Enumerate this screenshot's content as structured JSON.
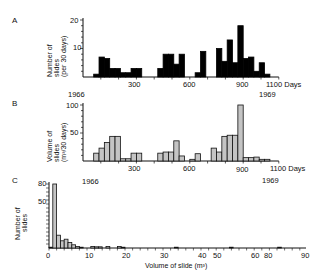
{
  "chart_data": [
    {
      "panel": "A",
      "type": "bar",
      "ylabel": "Number of slides (per 30 days)",
      "xlabel": "Days",
      "x_ticks": [
        "300",
        "600",
        "900",
        "1100 Days"
      ],
      "y_ticks": [
        "10",
        "20"
      ],
      "ylim": [
        0,
        20
      ],
      "xlim": [
        0,
        1100
      ],
      "bin_width_days": 30,
      "bins": [
        {
          "start": 60,
          "value": 1
        },
        {
          "start": 90,
          "value": 7
        },
        {
          "start": 120,
          "value": 6.5
        },
        {
          "start": 150,
          "value": 3
        },
        {
          "start": 180,
          "value": 3
        },
        {
          "start": 210,
          "value": 1.5
        },
        {
          "start": 240,
          "value": 1.5
        },
        {
          "start": 270,
          "value": 3
        },
        {
          "start": 300,
          "value": 3
        },
        {
          "start": 420,
          "value": 3
        },
        {
          "start": 450,
          "value": 8
        },
        {
          "start": 480,
          "value": 8
        },
        {
          "start": 510,
          "value": 4.5
        },
        {
          "start": 540,
          "value": 8
        },
        {
          "start": 630,
          "value": 1.5
        },
        {
          "start": 660,
          "value": 9
        },
        {
          "start": 750,
          "value": 10
        },
        {
          "start": 780,
          "value": 5.5
        },
        {
          "start": 810,
          "value": 13
        },
        {
          "start": 840,
          "value": 5
        },
        {
          "start": 870,
          "value": 18
        },
        {
          "start": 900,
          "value": 6.5
        },
        {
          "start": 930,
          "value": 7
        },
        {
          "start": 960,
          "value": 2
        },
        {
          "start": 990,
          "value": 5
        },
        {
          "start": 1020,
          "value": 1
        }
      ]
    },
    {
      "panel": "B",
      "type": "bar",
      "ylabel": "Volume of slides (m³/30 days)",
      "xlabel": "Days",
      "x_ticks": [
        "300",
        "600",
        "900",
        "1100 Days"
      ],
      "y_ticks": [
        "50",
        "100"
      ],
      "ylim": [
        0,
        100
      ],
      "xlim": [
        0,
        1100
      ],
      "year_labels": [
        "1966",
        "1969"
      ],
      "bins": [
        {
          "start": 60,
          "value": 14
        },
        {
          "start": 90,
          "value": 23
        },
        {
          "start": 120,
          "value": 33
        },
        {
          "start": 150,
          "value": 44
        },
        {
          "start": 180,
          "value": 44
        },
        {
          "start": 210,
          "value": 4
        },
        {
          "start": 240,
          "value": 4
        },
        {
          "start": 270,
          "value": 14
        },
        {
          "start": 300,
          "value": 14
        },
        {
          "start": 420,
          "value": 14
        },
        {
          "start": 450,
          "value": 16
        },
        {
          "start": 480,
          "value": 16
        },
        {
          "start": 510,
          "value": 36
        },
        {
          "start": 540,
          "value": 9
        },
        {
          "start": 600,
          "value": 3
        },
        {
          "start": 630,
          "value": 13
        },
        {
          "start": 720,
          "value": 23
        },
        {
          "start": 750,
          "value": 16
        },
        {
          "start": 780,
          "value": 44
        },
        {
          "start": 810,
          "value": 46
        },
        {
          "start": 840,
          "value": 46
        },
        {
          "start": 870,
          "value": 100
        },
        {
          "start": 900,
          "value": 6
        },
        {
          "start": 930,
          "value": 6
        },
        {
          "start": 960,
          "value": 7
        },
        {
          "start": 990,
          "value": 3
        },
        {
          "start": 1020,
          "value": 3
        }
      ]
    },
    {
      "panel": "C",
      "type": "bar",
      "ylabel": "Number of slides",
      "xlabel": "Volume of slide (m³)",
      "x_ticks": [
        "0",
        "10",
        "20",
        "30",
        "40",
        "50",
        "60",
        "80",
        "90"
      ],
      "y_ticks": [
        "50",
        "80"
      ],
      "ylim": [
        0,
        80
      ],
      "year_labels": [
        "1966",
        "1969"
      ],
      "bins": [
        {
          "start": 0,
          "value": 1
        },
        {
          "start": 1,
          "value": 80
        },
        {
          "start": 2,
          "value": 16
        },
        {
          "start": 3,
          "value": 9
        },
        {
          "start": 4,
          "value": 11
        },
        {
          "start": 5,
          "value": 7
        },
        {
          "start": 6,
          "value": 4
        },
        {
          "start": 7,
          "value": 2
        },
        {
          "start": 8,
          "value": 1
        },
        {
          "start": 11,
          "value": 2
        },
        {
          "start": 12,
          "value": 1.5
        },
        {
          "start": 13,
          "value": 1.5
        },
        {
          "start": 15,
          "value": 2
        },
        {
          "start": 18,
          "value": 2
        },
        {
          "start": 19,
          "value": 1
        },
        {
          "start": 33,
          "value": 1
        },
        {
          "start": 53,
          "value": 1
        },
        {
          "start": 82,
          "value": 1
        }
      ]
    }
  ],
  "labels": {
    "panel_a": "A",
    "panel_b": "B",
    "panel_c": "C",
    "a_ylabel_1": "Number of",
    "a_ylabel_2": "slides",
    "a_ylabel_3": "(per 30 days)",
    "b_ylabel_1": "Volume of",
    "b_ylabel_2": "slides",
    "b_ylabel_3": "(m³/30 days)",
    "c_ylabel_1": "Number of",
    "c_ylabel_2": "slides",
    "c_xlabel": "Volume of slide (m³)",
    "year_start": "1966",
    "year_end": "1969",
    "tick_300": "300",
    "tick_600": "600",
    "tick_900": "900",
    "tick_1100": "1100 Days",
    "a_y10": "10",
    "a_y20": "20",
    "b_y50": "50",
    "b_y100": "100",
    "c_y50": "50",
    "c_y80": "80",
    "c_x0": "0",
    "c_x10": "10",
    "c_x20": "20",
    "c_x30": "30",
    "c_x40": "40",
    "c_x50": "50",
    "c_x60": "60",
    "c_x80": "80",
    "c_x90": "90"
  },
  "colors": {
    "bar_fill_a": "#000000",
    "bar_fill_b": "#c4c4c4",
    "bar_fill_c": "#c4c4c4",
    "axis": "#111111"
  }
}
